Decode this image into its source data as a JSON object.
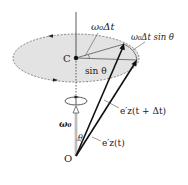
{
  "diagram": {
    "labels": {
      "center": "C",
      "origin": "O",
      "angle_increment": "ω₀Δt",
      "arc_length": "ω₀Δt sin θ",
      "radius": "sin θ",
      "angular_velocity": "ω₀",
      "polar_angle": "θ",
      "vector_later": "e′z(t + Δt)",
      "vector_now": "e′z(t)"
    },
    "colors": {
      "disk_fill": "#e3e3e3",
      "disk_edge": "#666666",
      "line": "#111111",
      "leader": "#555555"
    }
  }
}
